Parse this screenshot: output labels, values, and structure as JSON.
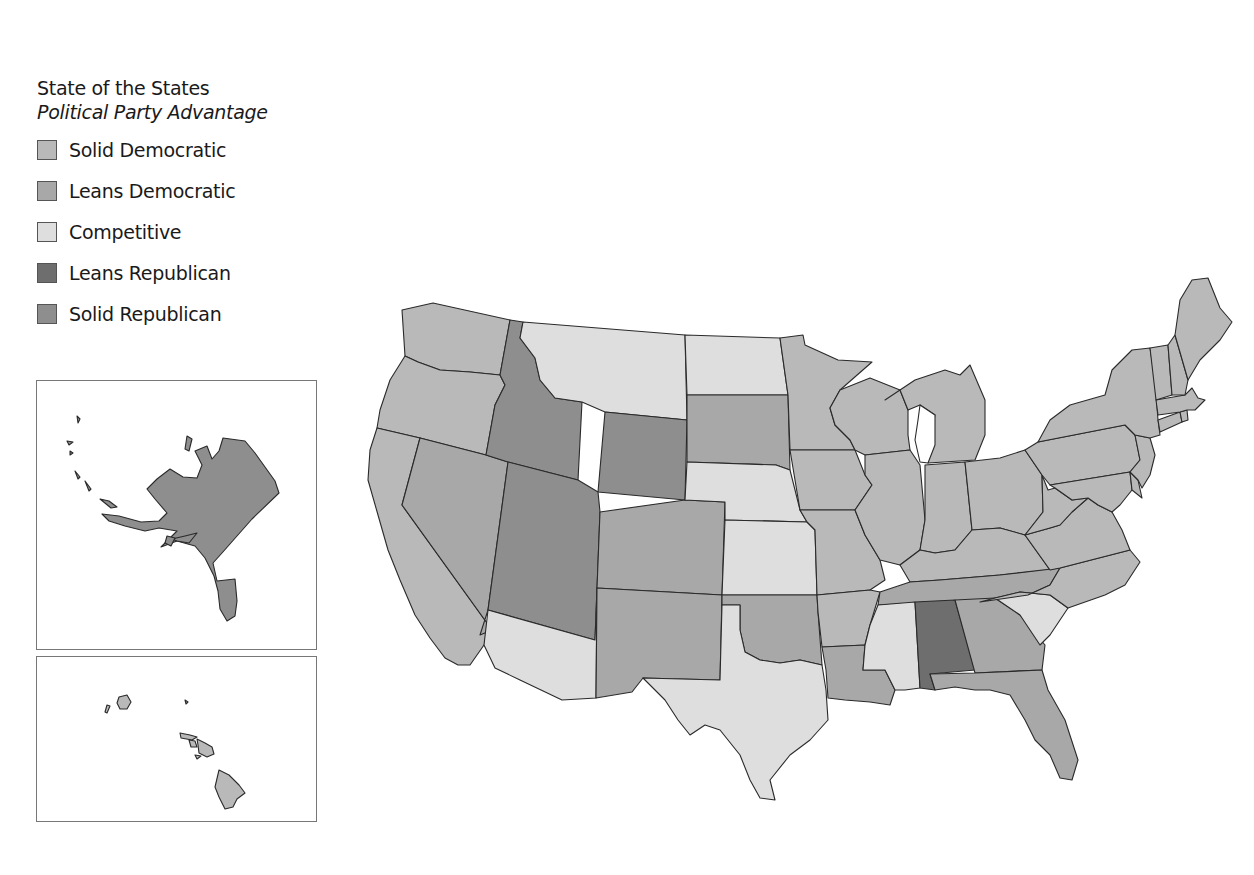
{
  "legend": {
    "title": "State of the States",
    "subtitle": "Political Party Advantage",
    "items": [
      {
        "key": "solid_dem",
        "label": "Solid Democratic",
        "color": "#b9b9b9"
      },
      {
        "key": "leans_dem",
        "label": "Leans Democratic",
        "color": "#a8a8a8"
      },
      {
        "key": "competitive",
        "label": "Competitive",
        "color": "#dedede"
      },
      {
        "key": "leans_rep",
        "label": "Leans Republican",
        "color": "#6e6e6e"
      },
      {
        "key": "solid_rep",
        "label": "Solid Republican",
        "color": "#8e8e8e"
      }
    ]
  },
  "insets": {
    "alaska": {
      "state": "AK",
      "category": "solid_rep"
    },
    "hawaii": {
      "state": "HI",
      "category": "solid_dem"
    }
  },
  "states": {
    "WA": "solid_dem",
    "OR": "solid_dem",
    "CA": "solid_dem",
    "NV": "leans_dem",
    "ID": "solid_rep",
    "MT": "competitive",
    "WY": "solid_rep",
    "UT": "solid_rep",
    "CO": "leans_dem",
    "AZ": "competitive",
    "NM": "leans_dem",
    "ND": "competitive",
    "SD": "leans_dem",
    "NE": "competitive",
    "KS": "competitive",
    "OK": "leans_dem",
    "TX": "competitive",
    "MN": "solid_dem",
    "IA": "solid_dem",
    "MO": "solid_dem",
    "AR": "solid_dem",
    "LA": "leans_dem",
    "WI": "solid_dem",
    "IL": "solid_dem",
    "MI": "solid_dem",
    "IN": "solid_dem",
    "OH": "solid_dem",
    "KY": "solid_dem",
    "TN": "leans_dem",
    "MS": "competitive",
    "AL": "leans_rep",
    "GA": "leans_dem",
    "FL": "leans_dem",
    "SC": "competitive",
    "NC": "solid_dem",
    "VA": "solid_dem",
    "WV": "solid_dem",
    "PA": "solid_dem",
    "NY": "solid_dem",
    "VT": "solid_dem",
    "NH": "solid_dem",
    "ME": "solid_dem",
    "MA": "solid_dem",
    "RI": "solid_dem",
    "CT": "solid_dem",
    "NJ": "solid_dem",
    "DE": "solid_dem",
    "MD": "solid_dem",
    "AK": "solid_rep",
    "HI": "solid_dem"
  },
  "colors": {
    "solid_dem": "#b9b9b9",
    "leans_dem": "#a8a8a8",
    "competitive": "#dedede",
    "leans_rep": "#6e6e6e",
    "solid_rep": "#8e8e8e",
    "border": "#2a2a2a",
    "water": "#ffffff"
  }
}
